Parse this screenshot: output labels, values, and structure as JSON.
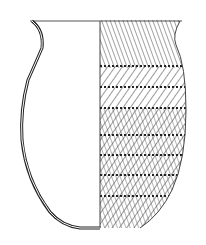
{
  "figure": {
    "view_left": "section profile",
    "view_right": "exterior decoration",
    "colors": {
      "ink": "#222222",
      "background": "#ffffff"
    },
    "bands_y": [
      66,
      87,
      108,
      135,
      155,
      175,
      196
    ]
  }
}
